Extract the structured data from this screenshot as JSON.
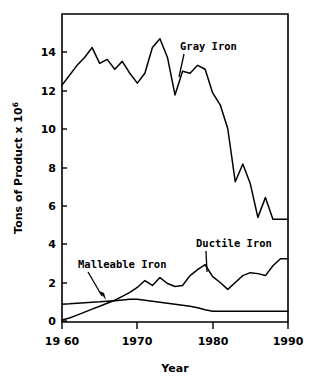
{
  "chart_data": {
    "type": "line",
    "title": "",
    "xlabel": "Year",
    "ylabel": "Tons of Product x 10",
    "ylabel_exponent": "6",
    "xlim": [
      1960,
      1990
    ],
    "ylim": [
      0,
      15.6
    ],
    "grid": false,
    "legend_position": "inline-annotations",
    "x_ticks": [
      1960,
      1970,
      1980,
      1990
    ],
    "x_tick_labels": [
      "19 60",
      "1970",
      "1980",
      "1990"
    ],
    "y_ticks": [
      0,
      2,
      4,
      6,
      8,
      10,
      12,
      14
    ],
    "y_tick_labels": [
      "0",
      "2",
      "4",
      "6",
      "8",
      "10",
      "12",
      "14"
    ],
    "x": [
      1960,
      1961,
      1962,
      1963,
      1964,
      1965,
      1966,
      1967,
      1968,
      1969,
      1970,
      1971,
      1972,
      1973,
      1974,
      1975,
      1976,
      1977,
      1978,
      1979,
      1980,
      1981,
      1982,
      1983,
      1984,
      1985,
      1986,
      1987,
      1988,
      1989,
      1990
    ],
    "series": [
      {
        "name": "Gray Iron",
        "label": "Gray Iron",
        "values": [
          12.0,
          12.5,
          13.0,
          13.4,
          13.9,
          13.1,
          13.3,
          12.8,
          13.2,
          12.6,
          12.1,
          12.6,
          13.9,
          14.35,
          13.4,
          11.5,
          12.7,
          12.6,
          13.0,
          12.8,
          11.6,
          11.0,
          9.8,
          7.1,
          8.0,
          7.0,
          5.3,
          6.3,
          5.2,
          5.2,
          5.2
        ]
      },
      {
        "name": "Ductile Iron",
        "label": "Ductile Iron",
        "values": [
          0.1,
          0.2,
          0.35,
          0.5,
          0.65,
          0.8,
          0.95,
          1.1,
          1.3,
          1.5,
          1.75,
          2.1,
          1.85,
          2.25,
          1.95,
          1.8,
          1.85,
          2.35,
          2.65,
          2.9,
          2.3,
          2.0,
          1.65,
          2.0,
          2.35,
          2.5,
          2.45,
          2.35,
          2.85,
          3.2,
          3.2
        ]
      },
      {
        "name": "Malleable Iron",
        "label": "Malleable Iron",
        "values": [
          0.9,
          0.92,
          0.95,
          0.98,
          1.0,
          1.02,
          1.05,
          1.08,
          1.12,
          1.15,
          1.15,
          1.1,
          1.05,
          1.0,
          0.95,
          0.9,
          0.85,
          0.8,
          0.72,
          0.62,
          0.55,
          0.55,
          0.55,
          0.55,
          0.55,
          0.55,
          0.55,
          0.55,
          0.55,
          0.55,
          0.55
        ]
      }
    ],
    "annotations": [
      {
        "text": "Gray Iron",
        "series": "Gray Iron",
        "x": 1976.0,
        "y": 14.55
      },
      {
        "text": "Ductile Iron",
        "series": "Ductile Iron",
        "x": 1979.0,
        "y": 3.85
      },
      {
        "text": "Malleable Iron",
        "series": "Malleable Iron",
        "x": 1965.5,
        "y": 3.0
      }
    ]
  },
  "axes": {
    "y_axis_title": "Tons of Product x 10",
    "y_axis_title_exponent": "6",
    "x_axis_title": "Year"
  }
}
